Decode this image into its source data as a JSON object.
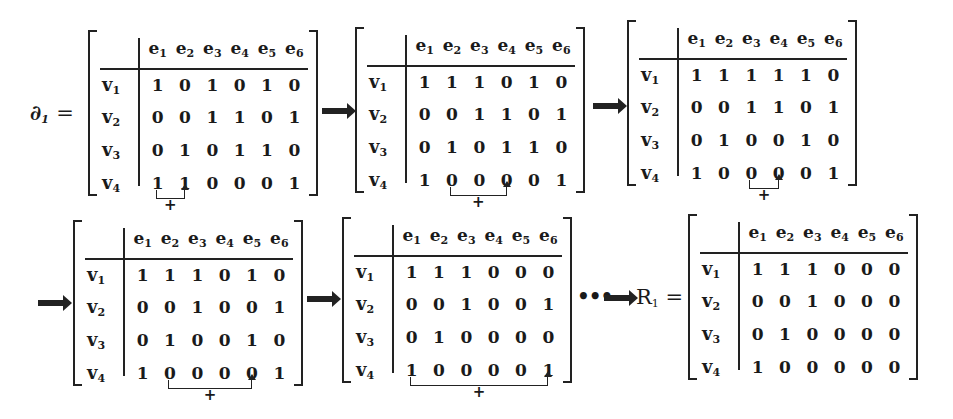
{
  "columns": [
    "e1",
    "e2",
    "e3",
    "e4",
    "e5",
    "e6"
  ],
  "rows": [
    "v1",
    "v2",
    "v3",
    "v4"
  ],
  "labels": {
    "start": "∂",
    "start_sub": "1",
    "end": "R",
    "end_sub": "1",
    "equals": "=",
    "ellipsis": "•••",
    "plus": "+"
  },
  "matrices": [
    {
      "id": "d1",
      "values": [
        [
          1,
          0,
          1,
          0,
          1,
          0
        ],
        [
          0,
          0,
          1,
          1,
          0,
          1
        ],
        [
          0,
          1,
          0,
          1,
          1,
          0
        ],
        [
          1,
          1,
          0,
          0,
          0,
          1
        ]
      ],
      "addition": {
        "from_col": "e1",
        "to_col": "e2"
      }
    },
    {
      "id": "step2",
      "values": [
        [
          1,
          1,
          1,
          0,
          1,
          0
        ],
        [
          0,
          0,
          1,
          1,
          0,
          1
        ],
        [
          0,
          1,
          0,
          1,
          1,
          0
        ],
        [
          1,
          0,
          0,
          0,
          0,
          1
        ]
      ],
      "addition": {
        "from_col": "e2",
        "to_col": "e4"
      }
    },
    {
      "id": "step3",
      "values": [
        [
          1,
          1,
          1,
          1,
          1,
          0
        ],
        [
          0,
          0,
          1,
          1,
          0,
          1
        ],
        [
          0,
          1,
          0,
          0,
          1,
          0
        ],
        [
          1,
          0,
          0,
          0,
          0,
          1
        ]
      ],
      "addition": {
        "from_col": "e3",
        "to_col": "e4"
      }
    },
    {
      "id": "step4",
      "values": [
        [
          1,
          1,
          1,
          0,
          1,
          0
        ],
        [
          0,
          0,
          1,
          0,
          0,
          1
        ],
        [
          0,
          1,
          0,
          0,
          1,
          0
        ],
        [
          1,
          0,
          0,
          0,
          0,
          1
        ]
      ],
      "addition": {
        "from_col": "e2",
        "to_col": "e5"
      }
    },
    {
      "id": "step5",
      "values": [
        [
          1,
          1,
          1,
          0,
          0,
          0
        ],
        [
          0,
          0,
          1,
          0,
          0,
          1
        ],
        [
          0,
          1,
          0,
          0,
          0,
          0
        ],
        [
          1,
          0,
          0,
          0,
          0,
          1
        ]
      ],
      "addition": {
        "from_col": "e1",
        "to_col": "e6"
      }
    },
    {
      "id": "R1",
      "values": [
        [
          1,
          1,
          1,
          0,
          0,
          0
        ],
        [
          0,
          0,
          1,
          0,
          0,
          0
        ],
        [
          0,
          1,
          0,
          0,
          0,
          0
        ],
        [
          1,
          0,
          0,
          0,
          0,
          0
        ]
      ],
      "addition": null
    }
  ]
}
